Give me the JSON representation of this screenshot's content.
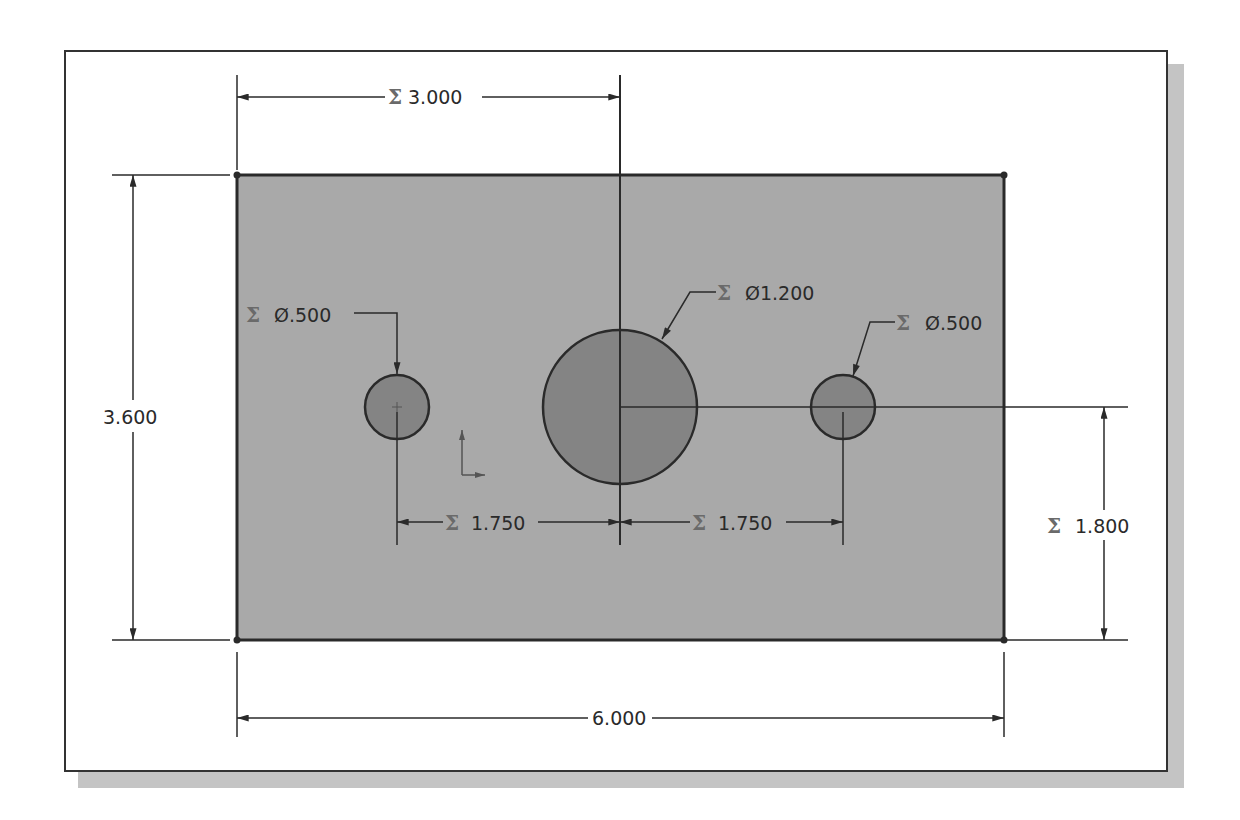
{
  "colors": {
    "plate_fill": "#a9a9a9",
    "hole_fill": "#848484",
    "line": "#2a2a2a",
    "frame_shadow": "#c4c4c4",
    "sigma": "#6a6a6a"
  },
  "plate": {
    "width_dim": "6.000",
    "height_dim": "3.600"
  },
  "dimensions": {
    "origin_to_center": {
      "symbol": "Σ",
      "value": "3.000"
    },
    "center_height": {
      "symbol": "Σ",
      "value": "1.800"
    },
    "left_hole_offset": {
      "symbol": "Σ",
      "value": "1.750"
    },
    "right_hole_offset": {
      "symbol": "Σ",
      "value": "1.750"
    },
    "left_hole_dia": {
      "symbol": "Σ",
      "value": "Ø.500"
    },
    "center_hole_dia": {
      "symbol": "Σ",
      "value": "Ø1.200"
    },
    "right_hole_dia": {
      "symbol": "Σ",
      "value": "Ø.500"
    },
    "overall_width": {
      "value": "6.000"
    },
    "overall_height": {
      "value": "3.600"
    }
  },
  "icons": {
    "origin": "coordinate-origin-icon"
  }
}
